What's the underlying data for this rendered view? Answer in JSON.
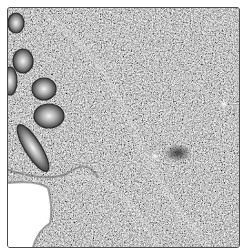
{
  "image": {
    "kind": "grayscale histology micrograph",
    "description": "Intestinal mucosa with glandular crypts along the left edge, dense cellular lamina propria stroma, and an empty lumen region at the lower left",
    "colors": {
      "stroma_dark": "#3a3a3a",
      "stroma_light": "#d8d8d8",
      "lumen": "#ffffff",
      "frame_border": "#4a4a4a"
    },
    "structures": [
      {
        "name": "crypt-1",
        "cx": 8,
        "cy": 15,
        "rx": 8,
        "ry": 10
      },
      {
        "name": "crypt-2",
        "cx": 15,
        "cy": 53,
        "rx": 10,
        "ry": 12
      },
      {
        "name": "crypt-3",
        "cx": 2,
        "cy": 73,
        "rx": 7,
        "ry": 14
      },
      {
        "name": "crypt-4",
        "cx": 36,
        "cy": 81,
        "rx": 12,
        "ry": 11
      },
      {
        "name": "crypt-5",
        "cx": 41,
        "cy": 108,
        "rx": 15,
        "ry": 12
      },
      {
        "name": "elongated-crypt",
        "cx": 25,
        "cy": 140,
        "rx": 9,
        "ry": 26,
        "rotate": -30
      },
      {
        "name": "lumen",
        "region": "bottom-left"
      },
      {
        "name": "bright-spot-1",
        "cx": 216,
        "cy": 96
      },
      {
        "name": "bright-spot-2",
        "cx": 147,
        "cy": 148
      },
      {
        "name": "dark-cluster",
        "cx": 170,
        "cy": 145
      }
    ]
  }
}
